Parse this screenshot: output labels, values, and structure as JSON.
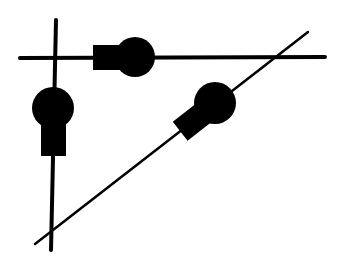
{
  "diagram": {
    "colors": {
      "background": "#ffffff",
      "ink": "#000000"
    },
    "lines": [
      {
        "id": "horizontal",
        "x1": 20,
        "y1": 58,
        "x2": 325,
        "y2": 57,
        "width": 4
      },
      {
        "id": "vertical",
        "x1": 56,
        "y1": 20,
        "x2": 51,
        "y2": 250,
        "width": 4
      },
      {
        "id": "diagonal",
        "x1": 35,
        "y1": 244,
        "x2": 308,
        "y2": 32,
        "width": 2.5
      }
    ],
    "bulbs": [
      {
        "id": "bulb-horizontal",
        "circle": {
          "cx": 135,
          "cy": 57,
          "r": 20
        },
        "base": {
          "x": 93,
          "y": 45,
          "w": 30,
          "h": 25
        }
      },
      {
        "id": "bulb-vertical",
        "circle": {
          "cx": 53,
          "cy": 108,
          "r": 21
        },
        "base": {
          "x": 41,
          "y": 124,
          "w": 25,
          "h": 32
        }
      },
      {
        "id": "bulb-diagonal",
        "circle": {
          "cx": 215,
          "cy": 103,
          "r": 21
        },
        "base": {
          "cx": 192,
          "cy": 122,
          "w": 30,
          "h": 24,
          "angle": -38
        }
      }
    ]
  }
}
